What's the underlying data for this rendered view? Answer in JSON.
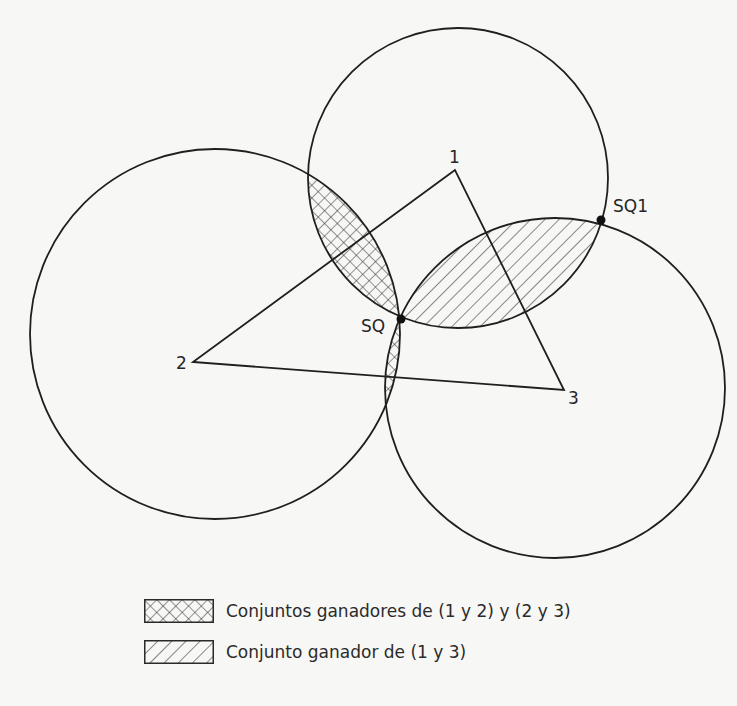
{
  "diagram": {
    "type": "spatial voting win-sets",
    "ideal_points": [
      {
        "label": "1",
        "x": 455,
        "y": 170
      },
      {
        "label": "2",
        "x": 193,
        "y": 362
      },
      {
        "label": "3",
        "x": 564,
        "y": 390
      }
    ],
    "status_quo": [
      {
        "label": "SQ",
        "x": 401,
        "y": 319
      },
      {
        "label": "SQ1",
        "x": 601,
        "y": 220
      }
    ],
    "circles": [
      {
        "name": "indifference-circle-1",
        "cx": 458,
        "cy": 178,
        "r": 150
      },
      {
        "name": "indifference-circle-2",
        "cx": 215,
        "cy": 334,
        "r": 185
      },
      {
        "name": "indifference-circle-3",
        "cx": 555,
        "cy": 388,
        "r": 170
      }
    ],
    "colors": {
      "line": "#1f1f1f",
      "background": "#f7f7f5",
      "hatch": "#2a2a2a"
    }
  },
  "labels": {
    "v1": "1",
    "v2": "2",
    "v3": "3",
    "sq": "SQ",
    "sq1": "SQ1"
  },
  "legend": {
    "items": [
      {
        "pattern": "crosshatch",
        "label": "Conjuntos ganadores de (1 y 2) y (2 y 3)"
      },
      {
        "pattern": "diagonal",
        "label": "Conjunto ganador de (1 y 3)"
      }
    ]
  }
}
